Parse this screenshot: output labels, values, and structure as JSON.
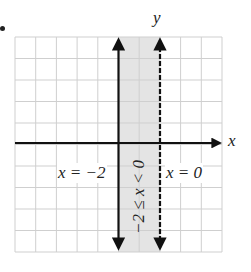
{
  "figure": {
    "type": "inequality-graph",
    "axes": {
      "x_label": "x",
      "y_label": "y"
    },
    "grid": {
      "columns": 10,
      "rows": 10,
      "color": "#cfcfcf"
    },
    "lines": [
      {
        "equation": "x = −2",
        "style": "solid",
        "x_value": -2
      },
      {
        "equation": "x = 0",
        "style": "dashed",
        "x_value": 0
      }
    ],
    "shaded_region": {
      "inequality": "−2 ≤ x < 0",
      "color": "#e4e4e4"
    }
  }
}
